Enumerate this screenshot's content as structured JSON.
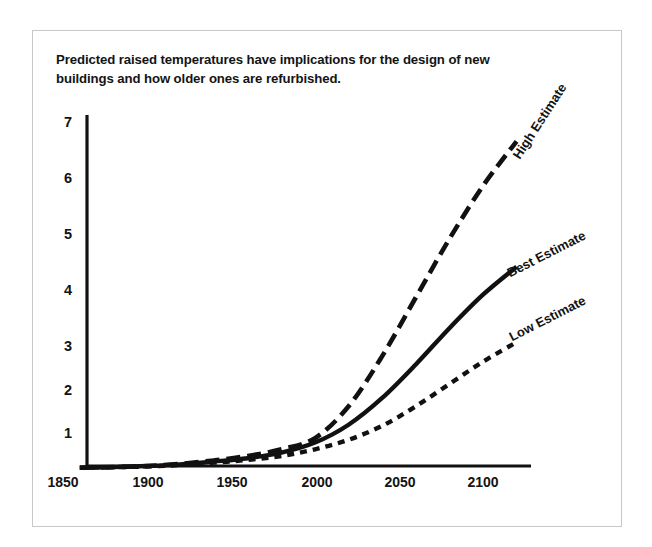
{
  "figure": {
    "caption": "Predicted raised temperatures have implications for the design of new buildings and how older ones are refurbished.",
    "frame_color": "#c8c8c8",
    "background": "#ffffff",
    "ink_color": "#111111"
  },
  "chart_data": {
    "type": "line",
    "title": "Predicted raised temperatures have implications for the design of new buildings and how older ones are refurbished.",
    "xlabel": "",
    "ylabel": "",
    "xlim": [
      1850,
      2120
    ],
    "ylim": [
      0,
      7
    ],
    "grid": false,
    "legend": "inline-end-labels",
    "xticks": [
      "1850",
      "1900",
      "1950",
      "2000",
      "2050",
      "2100"
    ],
    "xtick_values": [
      1850,
      1900,
      1950,
      2000,
      2050,
      2100
    ],
    "yticks": [
      "1",
      "2",
      "3",
      "4",
      "5",
      "6",
      "7"
    ],
    "ytick_values": [
      1,
      2,
      3,
      4,
      5,
      6,
      7
    ],
    "x": [
      1860,
      1880,
      1900,
      1920,
      1940,
      1960,
      1980,
      2000,
      2020,
      2040,
      2060,
      2080,
      2100,
      2120
    ],
    "series": [
      {
        "name": "High Estimate",
        "label": "High Estimate",
        "style": "dashed",
        "dash_pattern": "14 7",
        "width": 4.6,
        "color": "#111111",
        "label_rotation_deg": -57,
        "values": [
          0.45,
          0.46,
          0.48,
          0.52,
          0.58,
          0.66,
          0.78,
          0.98,
          1.55,
          2.45,
          3.5,
          4.55,
          5.5,
          6.3
        ]
      },
      {
        "name": "Best Estimate",
        "label": "Best Estimate",
        "style": "solid",
        "dash_pattern": "none",
        "width": 4.4,
        "color": "#111111",
        "label_rotation_deg": -27,
        "values": [
          0.45,
          0.46,
          0.48,
          0.51,
          0.56,
          0.62,
          0.72,
          0.9,
          1.22,
          1.7,
          2.3,
          2.95,
          3.55,
          4.05
        ]
      },
      {
        "name": "Low Estimate",
        "label": "Low Estimate",
        "style": "dotted",
        "dash_pattern": "7 6",
        "width": 4.4,
        "color": "#111111",
        "label_rotation_deg": -27,
        "values": [
          0.45,
          0.46,
          0.47,
          0.5,
          0.54,
          0.59,
          0.66,
          0.78,
          0.95,
          1.2,
          1.55,
          1.95,
          2.35,
          2.7
        ]
      }
    ]
  }
}
